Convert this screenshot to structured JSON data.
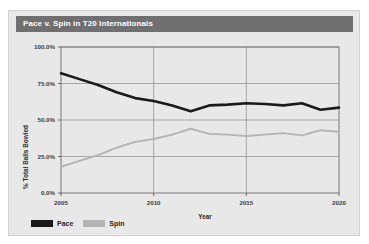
{
  "card": {
    "title": "Pace v. Spin in T20 Internationals"
  },
  "legend": [
    {
      "label": "Pace",
      "color": "#1a1a1a"
    },
    {
      "label": "Spin",
      "color": "#b4b4b4"
    }
  ],
  "chart_data": {
    "type": "line",
    "title": "Pace v. Spin in T20 Internationals",
    "xlabel": "Year",
    "ylabel": "% Total Balls Bowled",
    "xlim": [
      2005,
      2020
    ],
    "ylim": [
      0,
      100
    ],
    "xticks": [
      2005,
      2010,
      2015,
      2020
    ],
    "xticklabels": [
      "2005",
      "2010",
      "2015",
      "2020"
    ],
    "yticks": [
      0,
      25,
      50,
      75,
      100
    ],
    "yticklabels": [
      "0.0%",
      "25.0%",
      "50.0%",
      "75.0%",
      "100.0%"
    ],
    "grid": true,
    "legend_position": "below-left",
    "x": [
      2005,
      2006,
      2007,
      2008,
      2009,
      2010,
      2011,
      2012,
      2013,
      2014,
      2015,
      2016,
      2017,
      2018,
      2019,
      2020
    ],
    "series": [
      {
        "name": "Pace",
        "color": "#1a1a1a",
        "values": [
          82,
          78,
          74,
          69,
          65,
          63,
          60,
          56,
          60,
          60.5,
          61.5,
          61,
          60,
          61.5,
          57,
          58.5
        ]
      },
      {
        "name": "Spin",
        "color": "#b4b4b4",
        "values": [
          18,
          22,
          26,
          31,
          35,
          37,
          40,
          44,
          40.5,
          40,
          39,
          40,
          41,
          39.5,
          43,
          42
        ]
      }
    ]
  }
}
